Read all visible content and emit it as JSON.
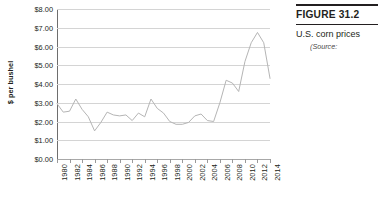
{
  "figure": {
    "number_label": "FIGURE 31.2",
    "caption": "U.S. corn prices",
    "source": "(Source:"
  },
  "chart_data": {
    "type": "line",
    "title": "",
    "xlabel": "",
    "ylabel": "$ per bushel",
    "xlim": [
      1980,
      2014
    ],
    "ylim": [
      0,
      8
    ],
    "grid": true,
    "legend_position": "none",
    "y_ticks": [
      "$0.00",
      "$1.00",
      "$2.00",
      "$3.00",
      "$4.00",
      "$5.00",
      "$6.00",
      "$7.00",
      "$8.00"
    ],
    "y_tick_values": [
      0,
      1,
      2,
      3,
      4,
      5,
      6,
      7,
      8
    ],
    "x_ticks": [
      "1980",
      "1982",
      "1984",
      "1986",
      "1988",
      "1990",
      "1992",
      "1994",
      "1996",
      "1998",
      "2000",
      "2002",
      "2004",
      "2006",
      "2008",
      "2010",
      "2012",
      "2014"
    ],
    "x_tick_values": [
      1980,
      1982,
      1984,
      1986,
      1988,
      1990,
      1992,
      1994,
      1996,
      1998,
      2000,
      2002,
      2004,
      2006,
      2008,
      2010,
      2012,
      2014
    ],
    "series": [
      {
        "name": "U.S. corn price",
        "color": "#b5b5b5",
        "x": [
          1980,
          1981,
          1982,
          1983,
          1984,
          1985,
          1986,
          1987,
          1988,
          1989,
          1990,
          1991,
          1992,
          1993,
          1994,
          1995,
          1996,
          1997,
          1998,
          1999,
          2000,
          2001,
          2002,
          2003,
          2004,
          2005,
          2006,
          2007,
          2008,
          2009,
          2010,
          2011,
          2012,
          2013,
          2014
        ],
        "values": [
          2.95,
          2.5,
          2.55,
          3.2,
          2.65,
          2.25,
          1.5,
          1.95,
          2.5,
          2.35,
          2.3,
          2.35,
          2.05,
          2.45,
          2.25,
          3.2,
          2.7,
          2.45,
          2.0,
          1.85,
          1.85,
          1.95,
          2.3,
          2.4,
          2.05,
          2.0,
          3.0,
          4.2,
          4.05,
          3.6,
          5.2,
          6.2,
          6.75,
          6.2,
          4.3
        ]
      }
    ]
  }
}
